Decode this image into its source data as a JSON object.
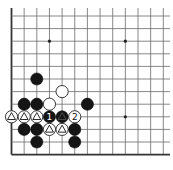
{
  "diagram": {
    "board": {
      "origin_x": 11.5,
      "origin_y": 16,
      "spacing_x": 12.65,
      "spacing_y": 12.6,
      "cols": 13,
      "rows": 12,
      "top_extend": 8,
      "right_extend": 170,
      "edges": [
        "left",
        "bottom"
      ]
    },
    "star_points": [
      {
        "col": 3,
        "row": 2
      },
      {
        "col": 9,
        "row": 2
      },
      {
        "col": 9,
        "row": 8
      }
    ],
    "stones": [
      {
        "col": 2,
        "row": 5,
        "color": "black"
      },
      {
        "col": 4,
        "row": 6,
        "color": "white"
      },
      {
        "col": 1,
        "row": 7,
        "color": "black"
      },
      {
        "col": 2,
        "row": 7,
        "color": "black"
      },
      {
        "col": 3,
        "row": 7,
        "color": "white"
      },
      {
        "col": 6,
        "row": 7,
        "color": "black"
      },
      {
        "col": 0,
        "row": 8,
        "color": "white",
        "mark": "triangle"
      },
      {
        "col": 1,
        "row": 8,
        "color": "white",
        "mark": "triangle"
      },
      {
        "col": 2,
        "row": 8,
        "color": "white",
        "mark": "triangle"
      },
      {
        "col": 3,
        "row": 8,
        "color": "black",
        "label": "1"
      },
      {
        "col": 4,
        "row": 8,
        "color": "black",
        "mark": "triangle"
      },
      {
        "col": 5,
        "row": 8,
        "color": "white",
        "label": "2"
      },
      {
        "col": 1,
        "row": 9,
        "color": "black"
      },
      {
        "col": 2,
        "row": 9,
        "color": "black"
      },
      {
        "col": 3,
        "row": 9,
        "color": "white",
        "mark": "triangle"
      },
      {
        "col": 4,
        "row": 9,
        "color": "white",
        "mark": "triangle"
      },
      {
        "col": 5,
        "row": 9,
        "color": "black"
      },
      {
        "col": 2,
        "row": 10,
        "color": "black"
      },
      {
        "col": 5,
        "row": 10,
        "color": "black"
      }
    ],
    "move_labels": [
      "1",
      "2"
    ]
  }
}
